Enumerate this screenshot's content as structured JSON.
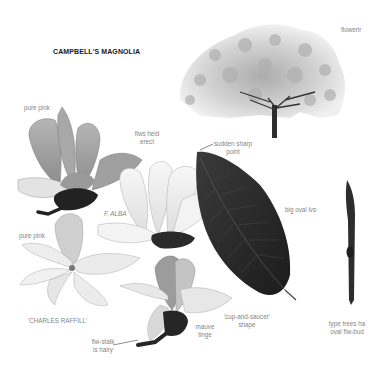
{
  "page": {
    "title": "CAMPBELL'S MAGNOLIA",
    "illustrations": [
      {
        "name": "flowering-tree",
        "caption": "flowerir"
      },
      {
        "name": "pink-flower-erect",
        "annotations": [
          "pure pink",
          "flws held erect"
        ]
      },
      {
        "name": "white-flower-alba",
        "annotations": [
          "F. ALBA"
        ]
      },
      {
        "name": "dark-leaf",
        "annotations": [
          "sudden sharp point",
          "big oval lvs"
        ]
      },
      {
        "name": "flower-charles-raffill",
        "annotations": [
          "pure pink",
          "'CHARLES RAFFILL'"
        ]
      },
      {
        "name": "cup-and-saucer-flower",
        "annotations": [
          "flw-stalk is hairy",
          "mauve tinge",
          "'cup-and-saucer' shape"
        ]
      },
      {
        "name": "flower-bud-twig",
        "annotations": [
          "type trees ha­ oval flw-bud"
        ]
      }
    ],
    "labels": {
      "flowering": "flowerir",
      "pure_pink_1": "pure pink",
      "flws_held_1": "flws held",
      "flws_held_2": "erect",
      "f_alba": "F. ALBA",
      "sudden_1": "sudden sharp",
      "sudden_2": "point",
      "big_oval": "big oval lvs",
      "pure_pink_2": "pure pink",
      "charles": "'CHARLES RAFFILL'",
      "stalk_1": "flw-stalk",
      "stalk_2": "is hairy",
      "mauve_1": "mauve",
      "mauve_2": "tinge",
      "cup_1": "'cup-and-saucer'",
      "cup_2": "shape",
      "type_1": "type trees ha",
      "type_2": "oval flw-bud"
    },
    "colors": {
      "title": "#1a1a1a",
      "annotation": "#858585",
      "leaf": "#2a2a2a",
      "petal_light": "#ececec",
      "petal_mid": "#bdbdbd",
      "petal_dark": "#8f8f8f"
    }
  }
}
